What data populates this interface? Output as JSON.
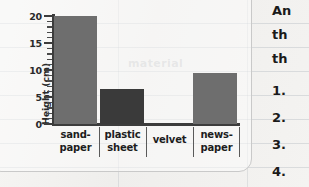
{
  "chart_data": {
    "type": "bar",
    "title": "",
    "xlabel": "",
    "ylabel": "Height (cm)",
    "categories": [
      "sand-paper",
      "plastic sheet",
      "velvet",
      "news-paper"
    ],
    "category_lines": [
      [
        "sand-",
        "paper"
      ],
      [
        "plastic",
        "sheet"
      ],
      [
        "velvet"
      ],
      [
        "news-",
        "paper"
      ]
    ],
    "values": [
      20,
      6.5,
      0,
      9.5
    ],
    "ylim": [
      0,
      20
    ],
    "yticks": [
      0,
      5,
      10,
      15,
      20
    ],
    "ytick_labels": [
      "0",
      "5",
      "10",
      "15",
      "20"
    ],
    "minor_tick_step": 1,
    "grid": false,
    "legend": false,
    "bar_colors": [
      "#6e6e6e",
      "#3a3a3a",
      "#6e6e6e",
      "#6e6e6e"
    ]
  },
  "worksheet": {
    "paragraph_fragments": [
      "An",
      "th",
      "th"
    ],
    "numbered_items": [
      "1.",
      "2.",
      "3.",
      "4."
    ]
  },
  "ghost": {
    "faint_line": "material"
  },
  "colors": {
    "bar_light": "#6e6e6e",
    "bar_dark": "#3a3a3a",
    "axis": "#3c3c3c",
    "page": "#f3f2f0",
    "rule_line": "#96a0aa"
  }
}
